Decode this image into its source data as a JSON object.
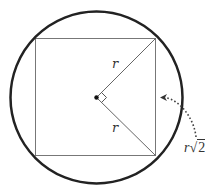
{
  "diagram": {
    "labels": {
      "radius_upper": "r",
      "radius_lower": "r",
      "side_var": "r",
      "side_radical": "√",
      "side_radicand": "2"
    },
    "shapes": {
      "circle": {
        "cx": 96.5,
        "cy": 97.5,
        "r": 86,
        "stroke": "#222222",
        "stroke_width": 2.5
      },
      "square": {
        "x": 35.5,
        "y": 38.5,
        "width": 120,
        "height": 117,
        "stroke": "#777777"
      },
      "center_dot": {
        "cx": 96.5,
        "cy": 97.5,
        "r": 2.2,
        "fill": "#111111"
      },
      "right_angle_marker": true,
      "dotted_arrow": {
        "from": [
          196,
          138
        ],
        "to": [
          161,
          97
        ]
      }
    },
    "colors": {
      "circle": "#222222",
      "square": "#777777",
      "radius": "#666666",
      "text": "#333333",
      "arrow": "#444444"
    }
  }
}
